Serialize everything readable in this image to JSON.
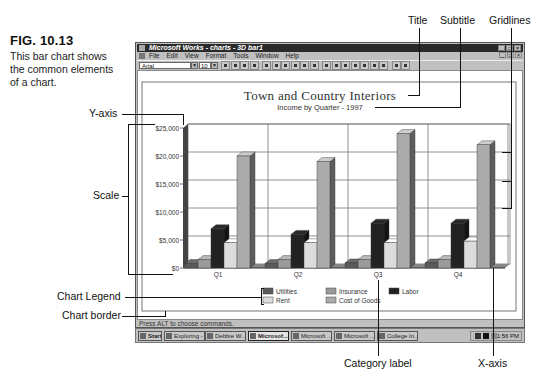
{
  "figure": {
    "number": "FIG. 10.13",
    "caption_lines": [
      "This bar chart shows",
      "the common elements",
      "of a chart."
    ]
  },
  "annotations": {
    "title": "Title",
    "subtitle": "Subtitle",
    "gridlines": "Gridlines",
    "y_axis": "Y-axis",
    "scale": "Scale",
    "chart_legend": "Chart Legend",
    "chart_border": "Chart border",
    "category_label": "Category label",
    "x_axis": "X-axis"
  },
  "window": {
    "title": "Microsoft Works - charts - 3D bar1",
    "menu": [
      "File",
      "Edit",
      "View",
      "Format",
      "Tools",
      "Window",
      "Help"
    ],
    "toolbar": {
      "font": "Arial",
      "size": "10",
      "button_count": 19
    },
    "status": "Press ALT to choose commands."
  },
  "taskbar": {
    "start": "Start",
    "buttons": [
      {
        "label": "Exploring - ...",
        "pressed": false
      },
      {
        "label": "Debbie W...",
        "pressed": false
      },
      {
        "label": "Microsof...",
        "pressed": true
      },
      {
        "label": "Microsoft ...",
        "pressed": false
      },
      {
        "label": "Microsoft ...",
        "pressed": false
      },
      {
        "label": "College In...",
        "pressed": false
      }
    ],
    "clock": "11:56 PM"
  },
  "chart_data": {
    "type": "bar",
    "style": "3d-clustered",
    "title": "Town and Country Interiors",
    "subtitle": "Income by Quarter - 1997",
    "xlabel": "",
    "ylabel": "",
    "categories": [
      "Q1",
      "Q2",
      "Q3",
      "Q4"
    ],
    "yticks": [
      "$0",
      "$5,000",
      "$10,000",
      "$15,000",
      "$20,000",
      "$25,000"
    ],
    "ylim": [
      0,
      25000
    ],
    "grid": true,
    "legend_position": "bottom",
    "series": [
      {
        "name": "Utilities",
        "color": "#5a5a5a",
        "values": [
          800,
          800,
          900,
          900
        ]
      },
      {
        "name": "Insurance",
        "color": "#9a9a9a",
        "values": [
          1500,
          1500,
          1500,
          1500
        ]
      },
      {
        "name": "Labor",
        "color": "#222222",
        "values": [
          7000,
          6000,
          8000,
          8000
        ]
      },
      {
        "name": "Rent",
        "color": "#dcdcdc",
        "values": [
          4500,
          4500,
          4500,
          4800
        ]
      },
      {
        "name": "Cost of Goods",
        "color": "#ababab",
        "values": [
          20000,
          19000,
          24000,
          22000
        ]
      }
    ]
  }
}
